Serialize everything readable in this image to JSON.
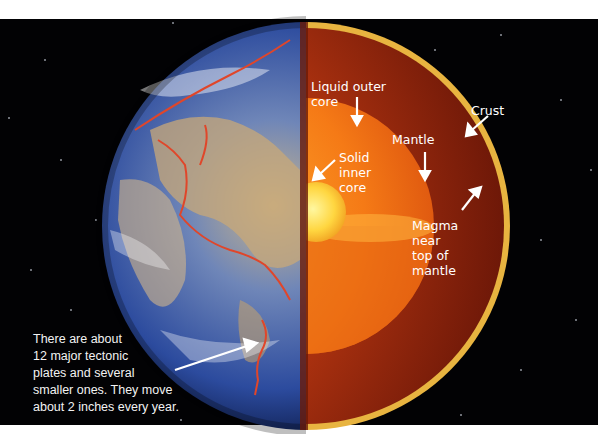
{
  "image": {
    "subject": "Cutaway diagram of Earth's interior layers",
    "background_color": "#020204"
  },
  "labels": {
    "liquid_outer_core": "Liquid outer core",
    "liquid_outer_core_line1": "Liquid outer",
    "liquid_outer_core_line2": "core",
    "solid_inner_core_line1": "Solid",
    "solid_inner_core_line2": "inner",
    "solid_inner_core_line3": "core",
    "mantle": "Mantle",
    "crust": "Crust",
    "magma_line1": "Magma",
    "magma_line2": "near",
    "magma_line3": "top of",
    "magma_line4": "mantle"
  },
  "caption": {
    "line1": "There are about",
    "line2": "12 major tectonic",
    "line3": "plates and several",
    "line4": "smaller ones. They move",
    "line5": "about 2 inches every year."
  },
  "colors": {
    "crust": "#e8b440",
    "mantle": "#8a1f0c",
    "outer_core": "#f07a14",
    "inner_core": "#ffe060",
    "plate_boundary": "#e0462a",
    "ocean": "#2a4a9a"
  }
}
